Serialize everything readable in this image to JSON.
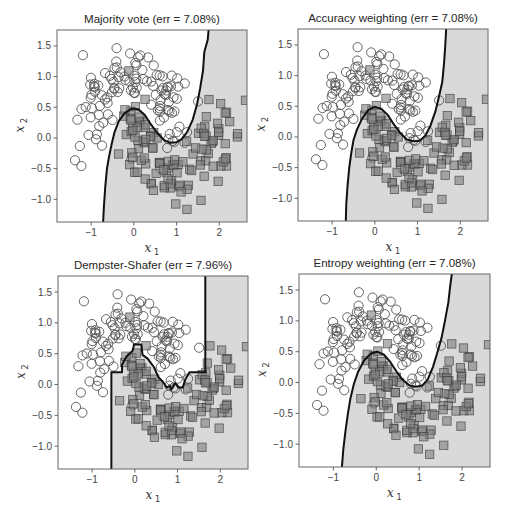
{
  "figure": {
    "width": 505,
    "height": 510,
    "background": "#ffffff"
  },
  "style": {
    "region_class1_color": "#d9d9d9",
    "region_class0_color": "#ffffff",
    "boundary_color": "#111111",
    "circle_edge_color": "#555555",
    "square_fill_color": "#7f7f7f",
    "square_fill_alpha": 0.6,
    "square_edge_color": "#333333",
    "frame_color": "#666666"
  },
  "chart_data": [
    {
      "type": "scatter",
      "title": "Majority vote (err = 7.08%)",
      "xlabel": "x",
      "xlabel_sub": "1",
      "ylabel": "x",
      "ylabel_sub": "2",
      "xlim": [
        -1.8,
        2.65
      ],
      "ylim": [
        -1.37,
        1.76
      ],
      "xticks": [
        -1,
        0,
        1,
        2
      ],
      "xtick_labels": [
        "−1",
        "0",
        "1",
        "2"
      ],
      "yticks": [
        -1.0,
        -0.5,
        0.0,
        0.5,
        1.0,
        1.5
      ],
      "ytick_labels": [
        "−1.0",
        "−0.5",
        "0.0",
        "0.5",
        "1.0",
        "1.5"
      ],
      "grid": false,
      "legend": "none",
      "series": [
        {
          "name": "class 0",
          "marker": "circle",
          "description": "upper moon"
        },
        {
          "name": "class 1",
          "marker": "square",
          "description": "lower moon"
        }
      ],
      "decision_boundary": [
        [
          -0.72,
          -1.37
        ],
        [
          -0.7,
          -1.1
        ],
        [
          -0.67,
          -0.8
        ],
        [
          -0.63,
          -0.5
        ],
        [
          -0.58,
          -0.3
        ],
        [
          -0.52,
          -0.1
        ],
        [
          -0.45,
          0.1
        ],
        [
          -0.35,
          0.28
        ],
        [
          -0.22,
          0.4
        ],
        [
          -0.05,
          0.48
        ],
        [
          0.1,
          0.47
        ],
        [
          0.25,
          0.38
        ],
        [
          0.4,
          0.22
        ],
        [
          0.55,
          0.08
        ],
        [
          0.7,
          -0.03
        ],
        [
          0.85,
          -0.08
        ],
        [
          1.0,
          -0.07
        ],
        [
          1.12,
          -0.02
        ],
        [
          1.25,
          0.1
        ],
        [
          1.38,
          0.3
        ],
        [
          1.48,
          0.55
        ],
        [
          1.55,
          0.8
        ],
        [
          1.62,
          1.1
        ],
        [
          1.65,
          1.4
        ],
        [
          1.73,
          1.6
        ],
        [
          1.75,
          1.76
        ]
      ],
      "error_rate": "7.08%"
    },
    {
      "type": "scatter",
      "title": "Accuracy weighting (err = 7.08%)",
      "xlabel": "x",
      "xlabel_sub": "1",
      "ylabel": "x",
      "ylabel_sub": "2",
      "xlim": [
        -1.8,
        2.65
      ],
      "ylim": [
        -1.37,
        1.76
      ],
      "xticks": [
        -1,
        0,
        1,
        2
      ],
      "xtick_labels": [
        "−1",
        "0",
        "1",
        "2"
      ],
      "yticks": [
        -1.0,
        -0.5,
        0.0,
        0.5,
        1.0,
        1.5
      ],
      "ytick_labels": [
        "−1.0",
        "−0.5",
        "0.0",
        "0.5",
        "1.0",
        "1.5"
      ],
      "grid": false,
      "legend": "none",
      "decision_boundary": [
        [
          -0.68,
          -1.37
        ],
        [
          -0.67,
          -1.1
        ],
        [
          -0.64,
          -0.8
        ],
        [
          -0.6,
          -0.5
        ],
        [
          -0.55,
          -0.25
        ],
        [
          -0.5,
          -0.05
        ],
        [
          -0.42,
          0.12
        ],
        [
          -0.3,
          0.3
        ],
        [
          -0.15,
          0.44
        ],
        [
          0.0,
          0.49
        ],
        [
          0.15,
          0.46
        ],
        [
          0.3,
          0.36
        ],
        [
          0.45,
          0.2
        ],
        [
          0.6,
          0.06
        ],
        [
          0.75,
          -0.04
        ],
        [
          0.9,
          -0.07
        ],
        [
          1.05,
          -0.06
        ],
        [
          1.18,
          0.02
        ],
        [
          1.3,
          0.18
        ],
        [
          1.42,
          0.42
        ],
        [
          1.5,
          0.65
        ],
        [
          1.58,
          0.9
        ],
        [
          1.62,
          1.2
        ],
        [
          1.65,
          1.5
        ],
        [
          1.67,
          1.76
        ]
      ],
      "error_rate": "7.08%"
    },
    {
      "type": "scatter",
      "title": "Dempster-Shafer (err = 7.96%)",
      "xlabel": "x",
      "xlabel_sub": "1",
      "ylabel": "x",
      "ylabel_sub": "2",
      "xlim": [
        -1.8,
        2.65
      ],
      "ylim": [
        -1.37,
        1.76
      ],
      "xticks": [
        -1,
        0,
        1,
        2
      ],
      "xtick_labels": [
        "−1",
        "0",
        "1",
        "2"
      ],
      "yticks": [
        -1.0,
        -0.5,
        0.0,
        0.5,
        1.0,
        1.5
      ],
      "ytick_labels": [
        "−1.0",
        "−0.5",
        "0.0",
        "0.5",
        "1.0",
        "1.5"
      ],
      "grid": false,
      "legend": "none",
      "decision_boundary": [
        [
          -0.55,
          -1.37
        ],
        [
          -0.55,
          0.2
        ],
        [
          -0.3,
          0.2
        ],
        [
          -0.3,
          0.32
        ],
        [
          -0.2,
          0.45
        ],
        [
          -0.05,
          0.55
        ],
        [
          -0.02,
          0.65
        ],
        [
          0.15,
          0.65
        ],
        [
          0.18,
          0.48
        ],
        [
          0.3,
          0.42
        ],
        [
          0.45,
          0.28
        ],
        [
          0.55,
          0.12
        ],
        [
          0.65,
          0.05
        ],
        [
          0.75,
          -0.05
        ],
        [
          0.82,
          -0.02
        ],
        [
          0.85,
          -0.08
        ],
        [
          0.95,
          0.02
        ],
        [
          1.02,
          -0.05
        ],
        [
          1.12,
          -0.05
        ],
        [
          1.18,
          0.08
        ],
        [
          1.28,
          0.2
        ],
        [
          1.65,
          0.2
        ],
        [
          1.65,
          1.76
        ]
      ],
      "error_rate": "7.96%"
    },
    {
      "type": "scatter",
      "title": "Entropy weighting (err = 7.08%)",
      "xlabel": "x",
      "xlabel_sub": "1",
      "ylabel": "x",
      "ylabel_sub": "2",
      "xlim": [
        -1.8,
        2.65
      ],
      "ylim": [
        -1.37,
        1.76
      ],
      "xticks": [
        -1,
        0,
        1,
        2
      ],
      "xtick_labels": [
        "−1",
        "0",
        "1",
        "2"
      ],
      "yticks": [
        -1.0,
        -0.5,
        0.0,
        0.5,
        1.0,
        1.5
      ],
      "ytick_labels": [
        "−1.0",
        "−0.5",
        "0.0",
        "0.5",
        "1.0",
        "1.5"
      ],
      "grid": false,
      "legend": "none",
      "decision_boundary": [
        [
          -0.8,
          -1.37
        ],
        [
          -0.77,
          -1.1
        ],
        [
          -0.72,
          -0.8
        ],
        [
          -0.66,
          -0.5
        ],
        [
          -0.6,
          -0.25
        ],
        [
          -0.52,
          -0.02
        ],
        [
          -0.42,
          0.18
        ],
        [
          -0.28,
          0.36
        ],
        [
          -0.12,
          0.47
        ],
        [
          0.02,
          0.5
        ],
        [
          0.18,
          0.45
        ],
        [
          0.33,
          0.33
        ],
        [
          0.48,
          0.17
        ],
        [
          0.62,
          0.04
        ],
        [
          0.78,
          -0.05
        ],
        [
          0.92,
          -0.07
        ],
        [
          1.07,
          -0.05
        ],
        [
          1.2,
          0.05
        ],
        [
          1.32,
          0.25
        ],
        [
          1.42,
          0.48
        ],
        [
          1.52,
          0.72
        ],
        [
          1.6,
          1.0
        ],
        [
          1.68,
          1.3
        ],
        [
          1.72,
          1.55
        ],
        [
          1.76,
          1.76
        ]
      ],
      "error_rate": "7.08%"
    }
  ],
  "dataset": {
    "name": "two moons",
    "n_per_class": 113,
    "noise": 0.25,
    "seed": 7,
    "class0_marker": "circle",
    "class1_marker": "square"
  },
  "panels": [
    {
      "title": "Majority vote (err = 7.08%)",
      "left": 57,
      "top": 30,
      "width": 190,
      "height": 192
    },
    {
      "title": "Accuracy weighting (err = 7.08%)",
      "left": 298,
      "top": 29,
      "width": 190,
      "height": 192
    },
    {
      "title": "Dempster-Shafer (err = 7.96%)",
      "left": 58,
      "top": 276,
      "width": 190,
      "height": 193
    },
    {
      "title": "Entropy weighting (err = 7.08%)",
      "left": 299,
      "top": 274,
      "width": 191,
      "height": 193
    }
  ]
}
